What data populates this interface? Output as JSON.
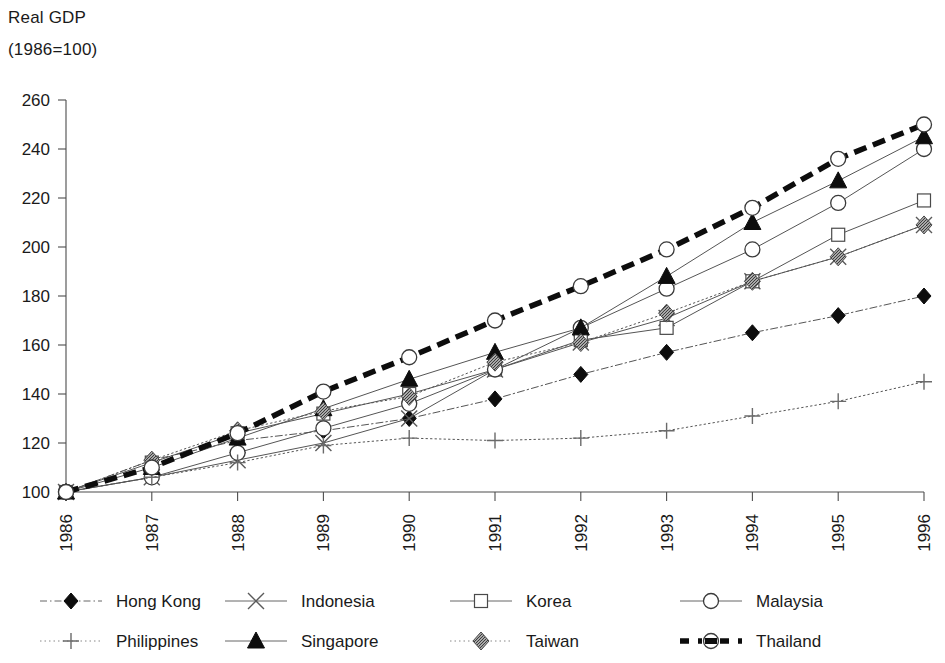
{
  "title": {
    "line1": "Real GDP",
    "line2": "(1986=100)"
  },
  "axes": {
    "y_ticks": [
      "100",
      "120",
      "140",
      "160",
      "180",
      "200",
      "220",
      "240",
      "260"
    ],
    "x_ticks": [
      "1986",
      "1987",
      "1988",
      "1989",
      "1990",
      "1991",
      "1992",
      "1993",
      "1994",
      "1995",
      "1996"
    ]
  },
  "legend": [
    {
      "label": "Hong Kong",
      "marker": "filled-diamond",
      "line": "dash-dot",
      "color": "#111111"
    },
    {
      "label": "Indonesia",
      "marker": "cross-x",
      "line": "solid",
      "color": "#555555"
    },
    {
      "label": "Korea",
      "marker": "open-square",
      "line": "solid",
      "color": "#555555"
    },
    {
      "label": "Malaysia",
      "marker": "open-circle",
      "line": "solid",
      "color": "#555555"
    },
    {
      "label": "Philippines",
      "marker": "plus",
      "line": "dotted",
      "color": "#777777"
    },
    {
      "label": "Singapore",
      "marker": "filled-triangle",
      "line": "solid",
      "color": "#333333"
    },
    {
      "label": "Taiwan",
      "marker": "hatched-diamond",
      "line": "dotted",
      "color": "#666666"
    },
    {
      "label": "Thailand",
      "marker": "open-circle",
      "line": "thick-dash",
      "color": "#111111"
    }
  ],
  "chart_data": {
    "type": "line",
    "title": "Real GDP (1986=100)",
    "xlabel": "",
    "ylabel": "Real GDP (1986=100)",
    "x": [
      1986,
      1987,
      1988,
      1989,
      1990,
      1991,
      1992,
      1993,
      1994,
      1995,
      1996
    ],
    "categories": [
      "1986",
      "1987",
      "1988",
      "1989",
      "1990",
      "1991",
      "1992",
      "1993",
      "1994",
      "1995",
      "1996"
    ],
    "ylim": [
      100,
      260
    ],
    "xlim": [
      1986,
      1996
    ],
    "grid": false,
    "legend_position": "bottom",
    "series": [
      {
        "name": "Hong Kong",
        "marker": "filled-diamond",
        "line": "dash-dot",
        "values": [
          100,
          113,
          121,
          125,
          130,
          138,
          148,
          157,
          165,
          172,
          180
        ]
      },
      {
        "name": "Indonesia",
        "marker": "cross-x",
        "line": "solid",
        "values": [
          100,
          106,
          113,
          120,
          130,
          150,
          161,
          171,
          186,
          196,
          209
        ]
      },
      {
        "name": "Korea",
        "marker": "open-square",
        "line": "solid",
        "values": [
          100,
          112,
          124,
          132,
          140,
          150,
          162,
          167,
          186,
          205,
          219
        ]
      },
      {
        "name": "Malaysia",
        "marker": "open-circle",
        "line": "solid",
        "values": [
          100,
          106,
          116,
          126,
          136,
          150,
          167,
          183,
          199,
          218,
          240
        ]
      },
      {
        "name": "Philippines",
        "marker": "plus",
        "line": "dotted",
        "values": [
          100,
          106,
          112,
          119,
          122,
          121,
          122,
          125,
          131,
          137,
          145
        ]
      },
      {
        "name": "Singapore",
        "marker": "filled-triangle",
        "line": "solid",
        "values": [
          100,
          110,
          122,
          134,
          146,
          157,
          167,
          188,
          210,
          227,
          245
        ]
      },
      {
        "name": "Taiwan",
        "marker": "hatched-diamond",
        "line": "dotted",
        "values": [
          100,
          113,
          125,
          133,
          139,
          153,
          161,
          173,
          186,
          196,
          209
        ]
      },
      {
        "name": "Thailand",
        "marker": "open-circle",
        "line": "thick-dash",
        "values": [
          100,
          110,
          124,
          141,
          155,
          170,
          184,
          199,
          216,
          236,
          250
        ]
      }
    ]
  }
}
